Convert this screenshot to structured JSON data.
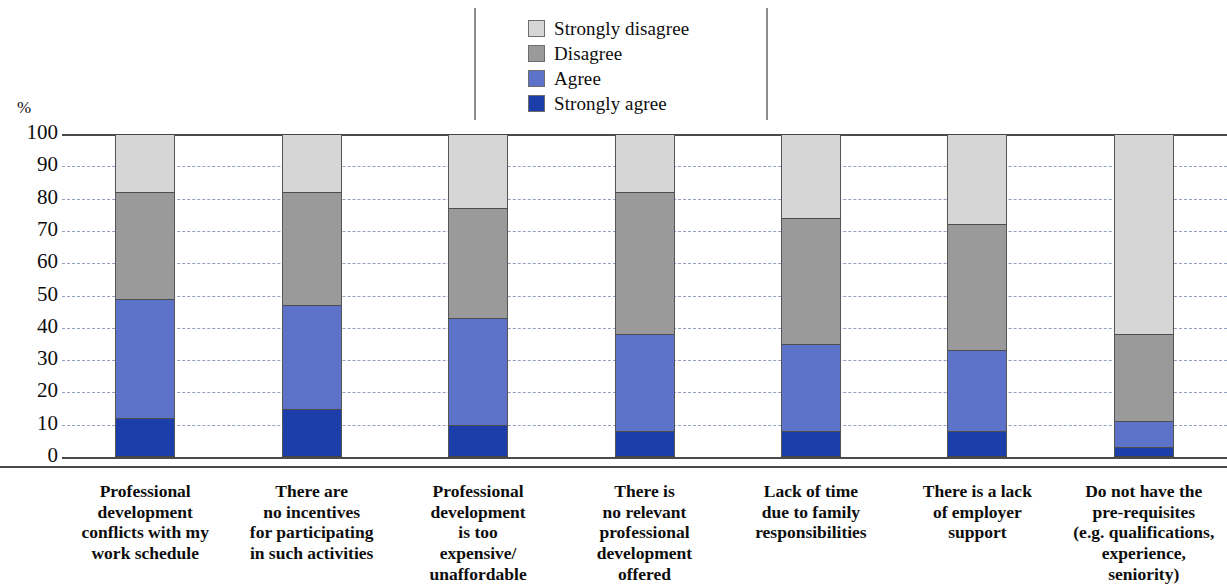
{
  "axis": {
    "unit_label": "%",
    "ticks": [
      "100",
      "90",
      "80",
      "70",
      "60",
      "50",
      "40",
      "30",
      "20",
      "10",
      "0"
    ]
  },
  "legend": {
    "items": [
      {
        "label": "Strongly disagree",
        "color": "#d6d6d6"
      },
      {
        "label": "Disagree",
        "color": "#9a9a9a"
      },
      {
        "label": "Agree",
        "color": "#5c73c9"
      },
      {
        "label": "Strongly agree",
        "color": "#1b3eaa"
      }
    ]
  },
  "chart_data": {
    "type": "bar",
    "title": "",
    "subtitle": "",
    "xlabel": "",
    "ylabel": "%",
    "ylim": [
      0,
      100
    ],
    "grid": true,
    "stacked": true,
    "legend_position": "top-center",
    "categories": [
      "Professional development conflicts with my work schedule",
      "There are no incentives for participating in such activities",
      "Professional development is too expensive/ unaffordable",
      "There is no relevant professional development offered",
      "Lack of time due to family responsibilities",
      "There is a lack of employer support",
      "Do not have the pre-requisites (e.g. qualifications, experience, seniority)"
    ],
    "category_lines": [
      [
        "Professional",
        "development",
        "conflicts with my",
        "work schedule"
      ],
      [
        "There are",
        "no incentives",
        "for participating",
        "in such activities"
      ],
      [
        "Professional",
        "development",
        "is too",
        "expensive/",
        "unaffordable"
      ],
      [
        "There is",
        "no relevant",
        "professional",
        "development",
        "offered"
      ],
      [
        "Lack of time",
        "due to family",
        "responsibilities"
      ],
      [
        "There is a lack",
        "of employer",
        "support"
      ],
      [
        "Do not have the",
        "pre-requisites",
        "(e.g. qualifications,",
        "experience,",
        "seniority)"
      ]
    ],
    "series": [
      {
        "name": "Strongly agree",
        "color": "#1b3eaa",
        "values": [
          12,
          15,
          10,
          8,
          8,
          8,
          3
        ]
      },
      {
        "name": "Agree",
        "color": "#5c73c9",
        "values": [
          37,
          32,
          33,
          30,
          27,
          25,
          8
        ]
      },
      {
        "name": "Disagree",
        "color": "#9a9a9a",
        "values": [
          33,
          35,
          34,
          44,
          39,
          39,
          27
        ]
      },
      {
        "name": "Strongly disagree",
        "color": "#d6d6d6",
        "values": [
          18,
          18,
          23,
          18,
          26,
          28,
          62
        ]
      }
    ]
  }
}
